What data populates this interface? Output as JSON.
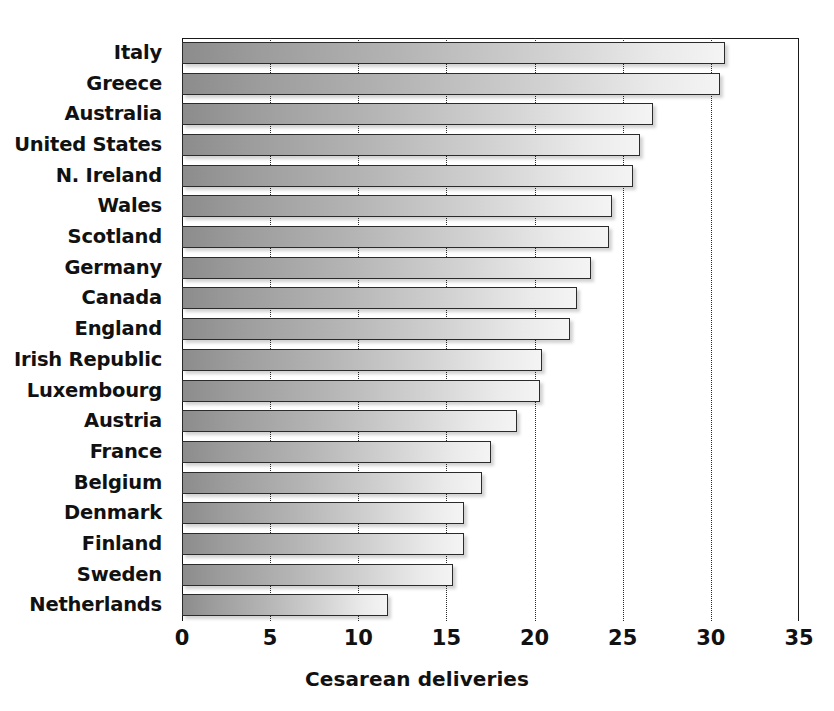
{
  "chart_data": {
    "type": "bar",
    "orientation": "horizontal",
    "title": "",
    "xlabel": "Cesarean deliveries",
    "ylabel": "",
    "xlim": [
      0,
      35
    ],
    "xticks": [
      0,
      5,
      10,
      15,
      20,
      25,
      30,
      35
    ],
    "xtick_labels": [
      "0",
      "5",
      "10",
      "15",
      "20",
      "25",
      "30",
      "35"
    ],
    "grid": "vertical-dotted",
    "legend": "none",
    "categories": [
      "Italy",
      "Greece",
      "Australia",
      "United States",
      "N. Ireland",
      "Wales",
      "Scotland",
      "Germany",
      "Canada",
      "England",
      "Irish Republic",
      "Luxembourg",
      "Austria",
      "France",
      "Belgium",
      "Denmark",
      "Finland",
      "Sweden",
      "Netherlands"
    ],
    "values": [
      30.8,
      30.5,
      26.7,
      26.0,
      25.6,
      24.4,
      24.2,
      23.2,
      22.4,
      22.0,
      20.4,
      20.3,
      19.0,
      17.5,
      17.0,
      16.0,
      16.0,
      15.4,
      11.7
    ],
    "bar_style": {
      "gradient_from": "#8c8c8c",
      "gradient_to": "#f4f4f4",
      "border_color": "#2b2b2b",
      "shadow": true
    }
  }
}
